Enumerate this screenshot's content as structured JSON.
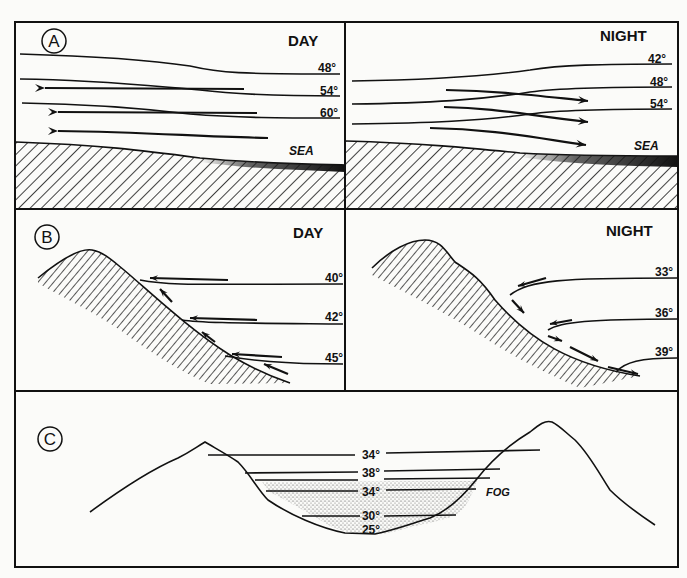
{
  "figure": {
    "background": "#fbfbf9",
    "ink_color": "#111111",
    "panels": {
      "A": {
        "letter": "A",
        "day": {
          "title": "DAY",
          "surface_label": "SEA",
          "isotherms": [
            "48°",
            "54°",
            "60°"
          ],
          "flow_direction": "left (toward land, sea breeze)"
        },
        "night": {
          "title": "NIGHT",
          "surface_label": "SEA",
          "isotherms": [
            "42°",
            "48°",
            "54°"
          ],
          "flow_direction": "right (toward sea, land breeze)"
        }
      },
      "B": {
        "letter": "B",
        "day": {
          "title": "DAY",
          "isotherms": [
            "40°",
            "42°",
            "45°"
          ],
          "flow_direction": "upslope"
        },
        "night": {
          "title": "NIGHT",
          "isotherms": [
            "33°",
            "36°",
            "39°"
          ],
          "flow_direction": "downslope"
        }
      },
      "C": {
        "letter": "C",
        "isotherms": [
          "34°",
          "38°",
          "34°",
          "30°",
          "25°"
        ],
        "fog_label": "FOG"
      }
    }
  }
}
